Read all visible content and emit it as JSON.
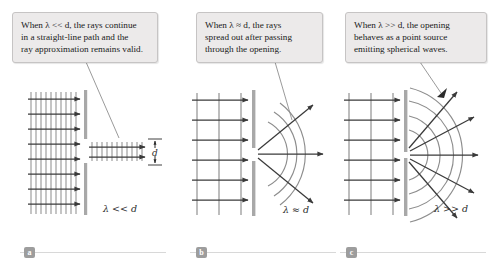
{
  "figure": {
    "background_color": "#ffffff"
  },
  "callouts": [
    {
      "id": "a",
      "text": "When λ << d, the rays continue in a straight-line path and the ray approximation remains valid.",
      "line1": "When λ << d, the rays continue",
      "line2": "in a straight-line path and the",
      "line3": "ray approximation remains valid.",
      "background_color": "#eceaea",
      "border_color": "#c6c4c4"
    },
    {
      "id": "b",
      "text": "When λ ≈ d, the rays spread out after passing through the opening.",
      "line1": "When λ ≈ d, the rays",
      "line2": "spread out after passing",
      "line3": "through the opening.",
      "background_color": "#eceaea",
      "border_color": "#c6c4c4"
    },
    {
      "id": "c",
      "text": "When λ >> d, the opening behaves as a point source emitting spherical waves.",
      "line1": "When λ >> d, the opening",
      "line2": "behaves as a point source",
      "line3": "emitting spherical waves.",
      "background_color": "#eceaea",
      "border_color": "#c6c4c4"
    }
  ],
  "panels": [
    {
      "id": "a",
      "index_label": "a",
      "condition_label": "λ << d",
      "slit_label": "d",
      "description": "Short wavelength: closely spaced plane wavefronts pass through the opening and continue as a straight beam with no spreading.",
      "wavefront_count": 10,
      "ray_count": 8,
      "spreading": "none"
    },
    {
      "id": "b",
      "index_label": "b",
      "condition_label": "λ ≈ d",
      "description": "Wavelength comparable to opening: wavefronts spread into curved arcs after the opening, rays fan out moderately.",
      "wavefront_count": 3,
      "ray_count": 6,
      "arc_count": 3,
      "outgoing_ray_count": 3,
      "spreading": "moderate"
    },
    {
      "id": "c",
      "index_label": "c",
      "condition_label": "λ >> d",
      "description": "Long wavelength: the narrow opening acts as a point source radiating nearly semicircular wavefronts in all forward directions.",
      "wavefront_count": 3,
      "ray_count": 6,
      "arc_count": 4,
      "outgoing_ray_count": 5,
      "spreading": "full"
    }
  ],
  "colors": {
    "wavefront": "#9a9a9a",
    "ray": "#3a3a3a",
    "barrier": "#a8a8a8",
    "arc": "#8d8d8d",
    "badge": "#9d9d9d",
    "rule": "#d8d8d8",
    "pointer": "#8f8f8f",
    "text": "#1a1a1a"
  },
  "index_bar": {
    "items": [
      "a",
      "b",
      "c"
    ]
  }
}
